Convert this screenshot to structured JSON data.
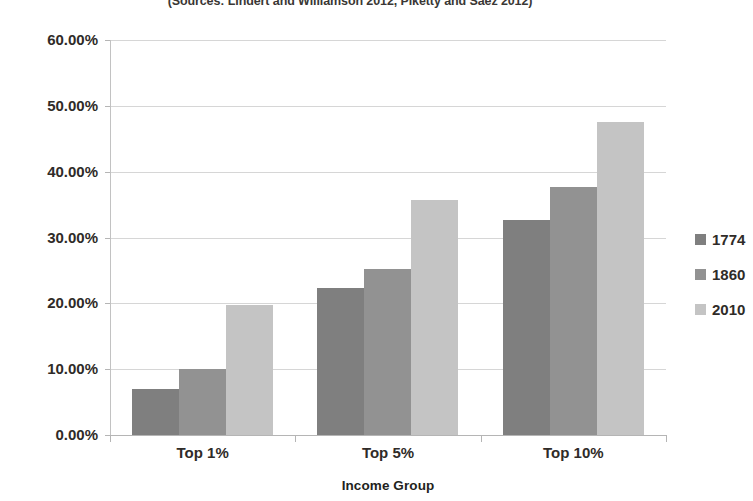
{
  "chart_data": {
    "type": "bar",
    "title": "(Sources: Lindert and Williamson 2012, Piketty and Saez 2012)",
    "subtitle": "(Sources: Lindert and Williamson 2012, Piketty and Saez 2012)",
    "xlabel": "Income Group",
    "ylabel": "Percent of U.S. Income",
    "categories": [
      "Top 1%",
      "Top 5%",
      "Top 10%"
    ],
    "ylim": [
      0,
      60
    ],
    "ytick_labels": [
      "0.00%",
      "10.00%",
      "20.00%",
      "30.00%",
      "40.00%",
      "50.00%",
      "60.00%"
    ],
    "ytick_values": [
      0,
      10,
      20,
      30,
      40,
      50,
      60
    ],
    "grid": true,
    "legend_position": "right",
    "series": [
      {
        "name": "1774",
        "color": "#7f7f7f",
        "values": [
          7.0,
          22.3,
          32.7
        ]
      },
      {
        "name": "1860",
        "color": "#929292",
        "values": [
          10.1,
          25.2,
          37.6
        ]
      },
      {
        "name": "2010",
        "color": "#c4c4c4",
        "values": [
          19.7,
          35.7,
          47.6
        ]
      }
    ]
  },
  "style": {
    "gridline_color": "#d6d6d6",
    "axis_color": "#b5b5b5",
    "text_color": "#231f20",
    "background": "#ffffff"
  }
}
